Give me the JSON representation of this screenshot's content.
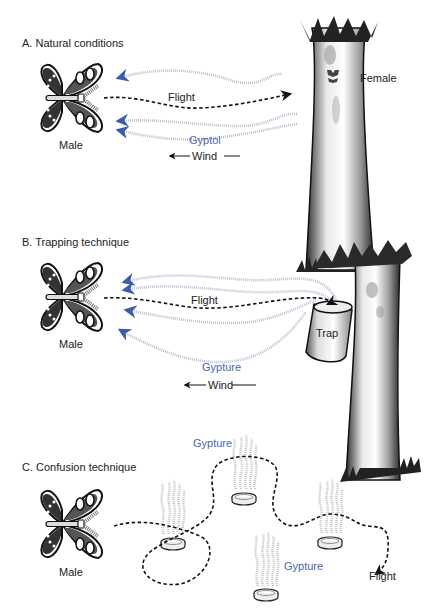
{
  "colors": {
    "text": "#222222",
    "pheromone_text": "#4a66a8",
    "pheromone_trail": "#a9b3c9",
    "flight_path": "#1a1a1a",
    "arrow_head_blue": "#3c5ca8"
  },
  "panels": [
    {
      "id": "A",
      "title": "A. Natural conditions",
      "male_label": "Male",
      "female_label": "Female",
      "flight_label": "Flight",
      "pheromone_label": "Gyptol",
      "wind_label": "Wind"
    },
    {
      "id": "B",
      "title": "B. Trapping technique",
      "male_label": "Male",
      "trap_label": "Trap",
      "flight_label": "Flight",
      "pheromone_label": "Gypture",
      "wind_label": "Wind"
    },
    {
      "id": "C",
      "title": "C. Confusion technique",
      "male_label": "Male",
      "pheromone_label_1": "Gypture",
      "pheromone_label_2": "Gypture",
      "flight_label": "Flight"
    }
  ],
  "icons": {
    "moth": "moth-icon",
    "tree": "tree-icon",
    "trap": "trap-bucket-icon",
    "dish": "pheromone-dish-icon",
    "wind_arrow": "left-arrow-icon"
  }
}
